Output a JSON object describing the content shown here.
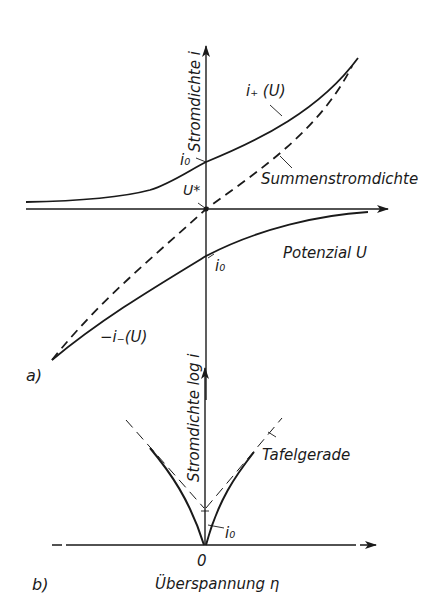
{
  "panel_a": {
    "label": "a)",
    "y_axis_label": "Stromdichte i",
    "x_axis_label": "Potenzial U",
    "curve_anodic_label": "i₊ (U)",
    "curve_cathodic_label": "−i₋(U)",
    "sum_curve_label": "Summenstromdichte",
    "i0_upper_label": "i₀",
    "i0_lower_label": "i₀",
    "equilibrium_label": "U*"
  },
  "panel_b": {
    "label": "b)",
    "y_axis_label": "Stromdichte log i",
    "x_axis_label": "Überspannung η",
    "origin_label": "0",
    "tafel_label": "Tafelgerade",
    "i0_label": "i₀"
  },
  "colors": {
    "ink": "#1a1a1a",
    "background": "#ffffff"
  }
}
